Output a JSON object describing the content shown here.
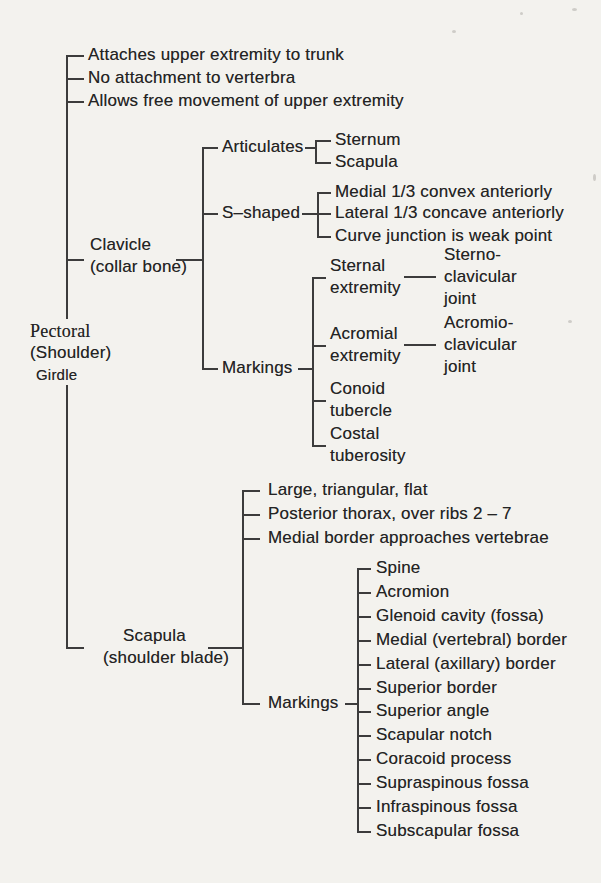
{
  "root": {
    "line1": "Pectoral",
    "line2": "(Shoulder)",
    "line3": "Girdle"
  },
  "general": {
    "items": [
      "Attaches upper extremity to trunk",
      "No attachment to verterbra",
      "Allows free movement of upper extremity"
    ]
  },
  "clavicle": {
    "name": "Clavicle",
    "subtitle": "(collar bone)",
    "articulates": {
      "label": "Articulates",
      "items": [
        "Sternum",
        "Scapula"
      ]
    },
    "s_shaped": {
      "label": "S–shaped",
      "items": [
        "Medial 1/3 convex anteriorly",
        "Lateral 1/3 concave anteriorly",
        "Curve junction is weak point"
      ]
    },
    "markings": {
      "label": "Markings",
      "sternal": {
        "line1": "Sternal",
        "line2": "extremity"
      },
      "sternal_joint": {
        "line1": "Sterno-",
        "line2": "clavicular",
        "line3": "joint"
      },
      "acromial": {
        "line1": "Acromial",
        "line2": "extremity"
      },
      "acromial_joint": {
        "line1": "Acromio-",
        "line2": "clavicular",
        "line3": "joint"
      },
      "conoid": {
        "line1": "Conoid",
        "line2": "tubercle"
      },
      "costal": {
        "line1": "Costal",
        "line2": "tuberosity"
      }
    }
  },
  "scapula": {
    "name": "Scapula",
    "subtitle": "(shoulder blade)",
    "features": [
      "Large, triangular, flat",
      "Posterior thorax,  over ribs 2 – 7",
      "Medial border  approaches vertebrae"
    ],
    "markings": {
      "label": "Markings",
      "items": [
        "Spine",
        "Acromion",
        "Glenoid cavity (fossa)",
        "Medial (vertebral) border",
        "Lateral (axillary) border",
        "Superior border",
        "Superior angle",
        "Scapular notch",
        "Coracoid process",
        "Supraspinous fossa",
        "Infraspinous fossa",
        "Subscapular fossa"
      ]
    }
  },
  "colors": {
    "background": "#f3f2ee",
    "ink": "#242424",
    "line": "#3c3c3c"
  }
}
